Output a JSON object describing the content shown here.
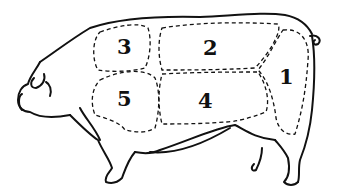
{
  "diagram": {
    "style": "black line drawing with dashed cut regions",
    "colors": {
      "line": "#111111",
      "background": "#ffffff"
    },
    "cuts": [
      {
        "number": "1",
        "region": "ham"
      },
      {
        "number": "2",
        "region": "loin"
      },
      {
        "number": "3",
        "region": "shoulder top"
      },
      {
        "number": "4",
        "region": "belly"
      },
      {
        "number": "5",
        "region": "shoulder/picnic"
      }
    ]
  }
}
